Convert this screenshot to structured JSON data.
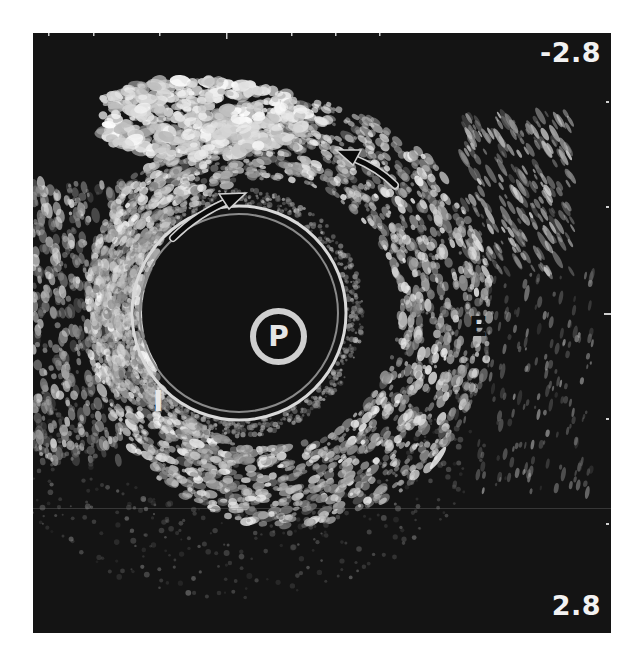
{
  "image": {
    "type": "intravascular ultrasound cross-section",
    "depth_scale": {
      "top": "-2.8",
      "bottom": "2.8"
    },
    "labels": {
      "probe": "P",
      "external": "E",
      "internal": "I"
    },
    "annotations": [
      {
        "type": "arrow",
        "direction": "up-right",
        "target": "inner layer boundary"
      },
      {
        "type": "arrow",
        "direction": "up-left",
        "target": "inner layer boundary"
      }
    ],
    "colors": {
      "background": "#141414",
      "tissue_bright": "#e6e6e6",
      "label_light": "#f2f2f2",
      "label_dark": "#111111",
      "page": "#ffffff"
    }
  }
}
